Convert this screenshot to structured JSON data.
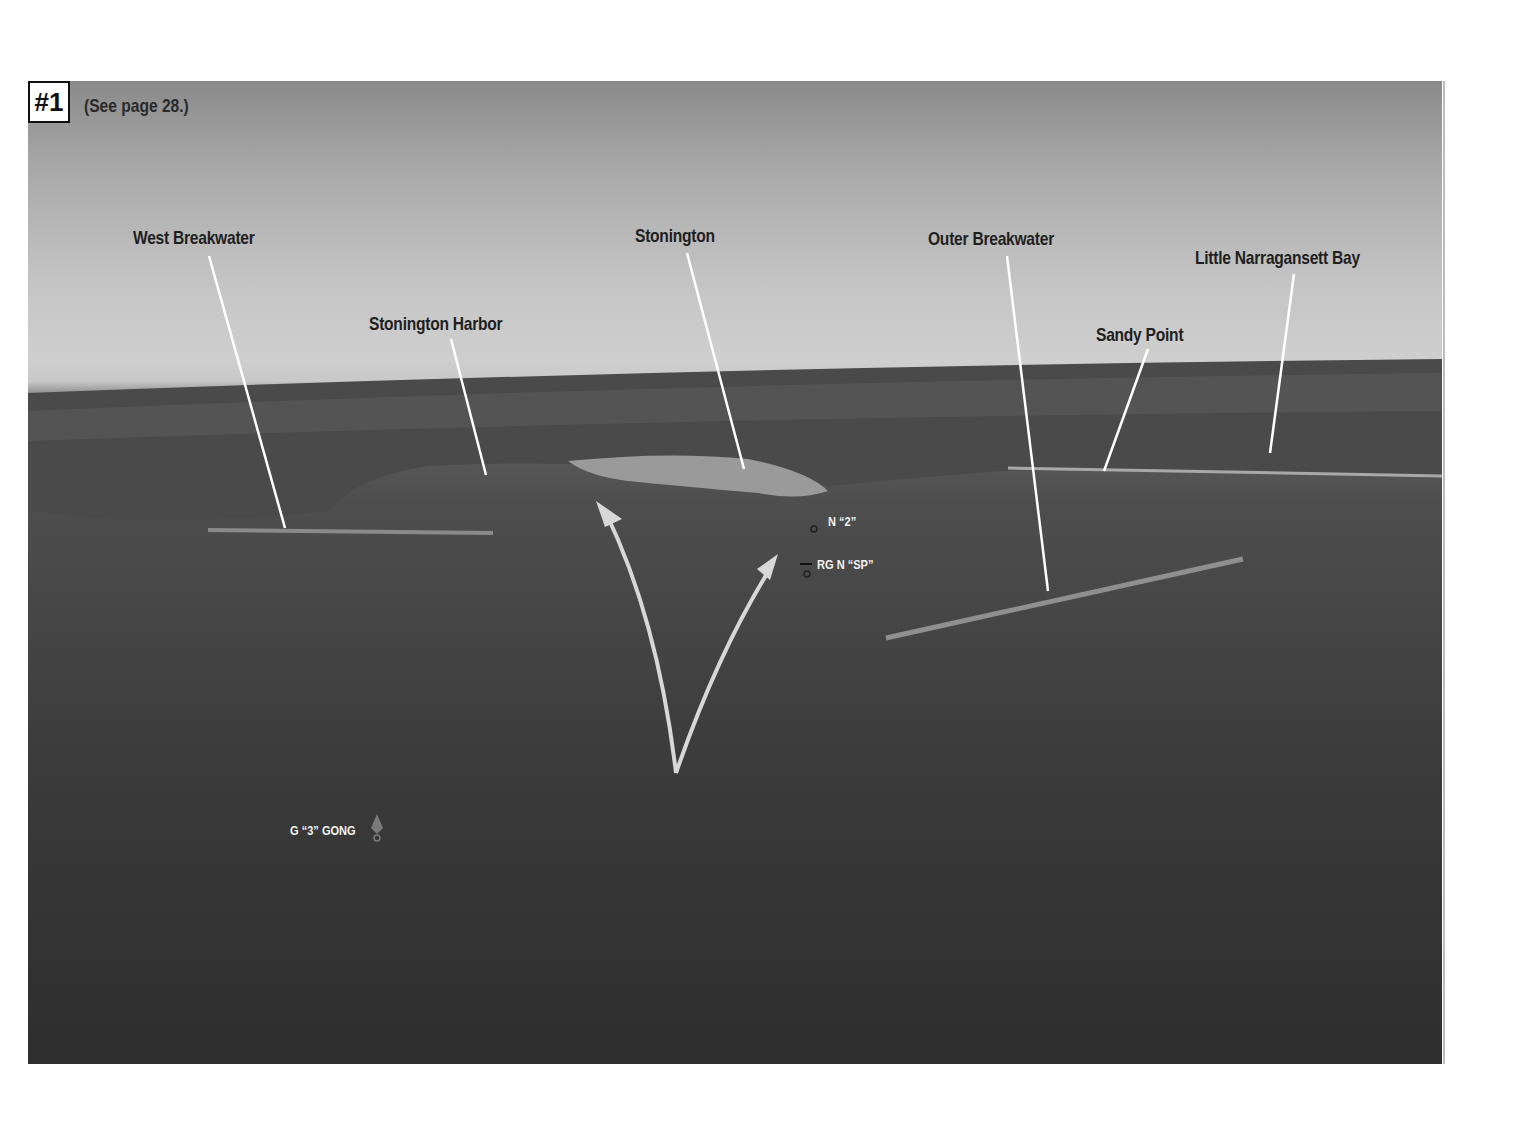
{
  "figure": {
    "number": "#1",
    "reference": "(See page 28.)"
  },
  "landmark_labels": [
    {
      "id": "west-breakwater",
      "text": "West Breakwater"
    },
    {
      "id": "stonington-harbor",
      "text": "Stonington Harbor"
    },
    {
      "id": "stonington",
      "text": "Stonington"
    },
    {
      "id": "outer-breakwater",
      "text": "Outer Breakwater"
    },
    {
      "id": "sandy-point",
      "text": "Sandy Point"
    },
    {
      "id": "little-narragansett-bay",
      "text": "Little Narragansett Bay"
    }
  ],
  "buoy_labels": [
    {
      "id": "n-2",
      "text": "N “2”"
    },
    {
      "id": "rg-n-sp",
      "text": "RG N “SP”"
    },
    {
      "id": "g-3-gong",
      "text": "G “3” GONG"
    }
  ],
  "colors": {
    "label_text": "#1f1f1f",
    "leader_lines": "#ffffff",
    "route_arrows": "#d8d8d8",
    "water": "#3a3a3a",
    "sky": "#c4c4c4"
  }
}
